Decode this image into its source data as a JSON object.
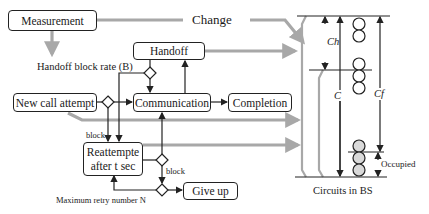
{
  "diagram": {
    "nodes": {
      "measurement": "Measurement",
      "handoff": "Handoff",
      "new_call": "New call attempt",
      "communication": "Communication",
      "completion": "Completion",
      "reattempt_line1": "Reattempte",
      "reattempt_line2": "after t sec",
      "give_up": "Give up"
    },
    "labels": {
      "change": "Change",
      "handoff_block_rate": "Handoff block rate (B)",
      "block_left": "block",
      "block_right": "block",
      "max_retry": "Maximum retry number N",
      "ch": "Ch",
      "c": "C",
      "cf": "Cf",
      "occupied": "Occupied",
      "circuits_caption": "Circuits in BS"
    },
    "colors": {
      "line": "#222222",
      "gray_arrow": "#a8a8a8",
      "occupied_fill": "#d9d9d9"
    }
  }
}
